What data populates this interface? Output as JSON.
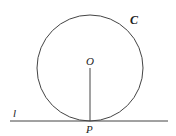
{
  "diagram": {
    "circle": {
      "label": "C",
      "cx": 90,
      "cy": 68,
      "r": 53
    },
    "center": {
      "label": "O"
    },
    "tangent_line": {
      "label": "l",
      "y": 121,
      "x1": 10,
      "x2": 168
    },
    "tangent_point": {
      "label": "P"
    },
    "colors": {
      "stroke": "#444444",
      "text": "#222222"
    }
  }
}
